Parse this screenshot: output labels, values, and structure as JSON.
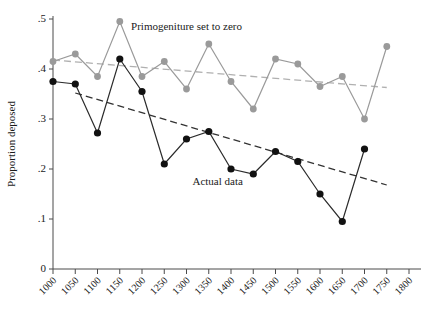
{
  "chart_data": {
    "type": "line",
    "title": "",
    "xlabel": "",
    "ylabel": "Proportion deposed",
    "xlim": [
      1000,
      1800
    ],
    "ylim": [
      0,
      0.5
    ],
    "grid": false,
    "legend_position": "inline-annotation",
    "x": [
      1000,
      1050,
      1100,
      1150,
      1200,
      1250,
      1300,
      1350,
      1400,
      1450,
      1500,
      1550,
      1600,
      1650,
      1700,
      1750
    ],
    "xtick_labels": [
      "1000",
      "1050",
      "1100",
      "1150",
      "1200",
      "1250",
      "1300",
      "1350",
      "1400",
      "1450",
      "1500",
      "1550",
      "1600",
      "1650",
      "1700",
      "1750",
      "1800"
    ],
    "xticks": [
      1000,
      1050,
      1100,
      1150,
      1200,
      1250,
      1300,
      1350,
      1400,
      1450,
      1500,
      1550,
      1600,
      1650,
      1700,
      1750,
      1800
    ],
    "ytick_labels": [
      "0",
      ".1",
      ".2",
      ".3",
      ".4",
      ".5"
    ],
    "yticks": [
      0,
      0.1,
      0.2,
      0.3,
      0.4,
      0.5
    ],
    "series": [
      {
        "name": "Primogeniture set to zero",
        "color": "#9a9a9a",
        "values": [
          0.415,
          0.43,
          0.385,
          0.495,
          0.385,
          0.415,
          0.36,
          0.45,
          0.375,
          0.32,
          0.42,
          0.41,
          0.365,
          0.385,
          0.3,
          0.445
        ],
        "trend": {
          "x": [
            1000,
            1750
          ],
          "y": [
            0.418,
            0.363
          ],
          "color": "#b0b0b0"
        }
      },
      {
        "name": "Actual data",
        "color": "#111111",
        "values": [
          0.375,
          0.37,
          0.272,
          0.42,
          0.355,
          0.21,
          0.26,
          0.275,
          0.2,
          0.19,
          0.235,
          0.215,
          0.15,
          0.095,
          0.24,
          null
        ],
        "trend": {
          "x": [
            1050,
            1750
          ],
          "y": [
            0.352,
            0.168
          ],
          "color": "#333333"
        }
      }
    ],
    "annotations": [
      {
        "text": "Primogeniture set to zero",
        "x": 1300,
        "y": 0.478
      },
      {
        "text": "Actual data",
        "x": 1370,
        "y": 0.168
      }
    ]
  }
}
